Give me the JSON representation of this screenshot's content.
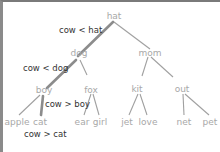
{
  "diagram": {
    "type": "binary-search-tree",
    "search_key": "cow",
    "nodes": {
      "hat": "hat",
      "dog": "dog",
      "mom": "mom",
      "boy": "boy",
      "fox": "fox",
      "kit": "kit",
      "out": "out",
      "apple": "apple",
      "cat": "cat",
      "ear": "ear",
      "girl": "girl",
      "jet": "jet",
      "love": "love",
      "net": "net",
      "pet": "pet"
    },
    "edges": [
      [
        "hat",
        "dog"
      ],
      [
        "hat",
        "mom"
      ],
      [
        "dog",
        "boy"
      ],
      [
        "dog",
        "fox"
      ],
      [
        "mom",
        "kit"
      ],
      [
        "mom",
        "out"
      ],
      [
        "boy",
        "apple"
      ],
      [
        "boy",
        "cat"
      ],
      [
        "fox",
        "ear"
      ],
      [
        "fox",
        "girl"
      ],
      [
        "kit",
        "jet"
      ],
      [
        "kit",
        "love"
      ],
      [
        "out",
        "net"
      ],
      [
        "out",
        "pet"
      ]
    ],
    "highlighted_path": [
      "hat",
      "dog",
      "boy",
      "cat"
    ],
    "comparisons": {
      "c1": "cow < hat",
      "c2": "cow < dog",
      "c3": "cow > boy",
      "c4": "cow > cat"
    },
    "colors": {
      "edge": "#9a9a9a",
      "path_edge": "#8c8c8c",
      "node_text": "#a8a8a8",
      "comparison_text": "#333333",
      "frame": "#7a7a7a"
    }
  }
}
